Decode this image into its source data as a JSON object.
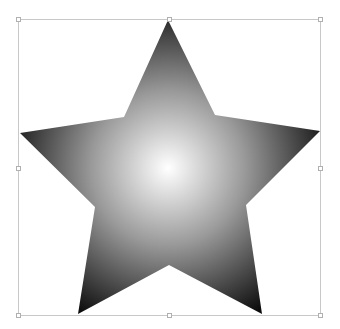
{
  "canvas": {
    "width": 340,
    "height": 329,
    "background": "#ffffff"
  },
  "shape": {
    "type": "star",
    "points": 5,
    "outer_vertices": [
      [
        168,
        20
      ],
      [
        320,
        131
      ],
      [
        262,
        314
      ],
      [
        78,
        314
      ],
      [
        20,
        133
      ]
    ],
    "inner_vertices": [
      [
        215,
        115
      ],
      [
        246,
        205
      ],
      [
        169,
        265
      ],
      [
        95,
        207
      ],
      [
        124,
        117
      ]
    ],
    "fill": {
      "type": "radial-gradient",
      "center": [
        168,
        168
      ],
      "stops": [
        {
          "offset": "0%",
          "color": "#ffffff"
        },
        {
          "offset": "45%",
          "color": "#9a9a9a"
        },
        {
          "offset": "100%",
          "color": "#0a0a0a"
        }
      ]
    }
  },
  "selection": {
    "bounding_box": {
      "x": 18,
      "y": 19,
      "width": 302,
      "height": 296
    },
    "stroke_color": "#c8c8c8",
    "handles": [
      {
        "name": "top-left",
        "x": 18,
        "y": 19
      },
      {
        "name": "top-center",
        "x": 169,
        "y": 19
      },
      {
        "name": "top-right",
        "x": 320,
        "y": 19
      },
      {
        "name": "middle-left",
        "x": 18,
        "y": 168
      },
      {
        "name": "middle-right",
        "x": 320,
        "y": 168
      },
      {
        "name": "bottom-left",
        "x": 18,
        "y": 315
      },
      {
        "name": "bottom-center",
        "x": 169,
        "y": 315
      },
      {
        "name": "bottom-right",
        "x": 320,
        "y": 315
      }
    ]
  }
}
